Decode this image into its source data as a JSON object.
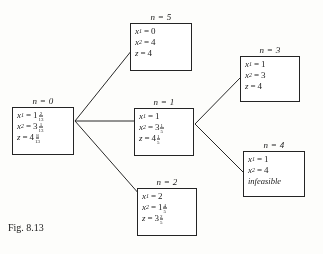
{
  "figure": {
    "caption": "Fig. 8.13",
    "type": "branch-and-bound-tree"
  },
  "nodes": [
    {
      "id": "0",
      "label": "n = 0",
      "rows": [
        {
          "var": "x",
          "sub": "1",
          "whole": "1",
          "num": "2",
          "den": "13"
        },
        {
          "var": "x",
          "sub": "2",
          "whole": "3",
          "num": "1",
          "den": "13"
        },
        {
          "var": "z",
          "sub": "",
          "whole": "4",
          "num": "8",
          "den": "13"
        }
      ]
    },
    {
      "id": "5",
      "label": "n = 5",
      "rows": [
        {
          "var": "x",
          "sub": "1",
          "whole": "0",
          "num": "",
          "den": ""
        },
        {
          "var": "x",
          "sub": "2",
          "whole": "4",
          "num": "",
          "den": ""
        },
        {
          "var": "z",
          "sub": "",
          "whole": "4",
          "num": "",
          "den": ""
        }
      ]
    },
    {
      "id": "1",
      "label": "n = 1",
      "rows": [
        {
          "var": "x",
          "sub": "1",
          "whole": "1",
          "num": "",
          "den": ""
        },
        {
          "var": "x",
          "sub": "2",
          "whole": "3",
          "num": "1",
          "den": "5"
        },
        {
          "var": "z",
          "sub": "",
          "whole": "4",
          "num": "1",
          "den": "5"
        }
      ]
    },
    {
      "id": "2",
      "label": "n = 2",
      "rows": [
        {
          "var": "x",
          "sub": "1",
          "whole": "2",
          "num": "",
          "den": ""
        },
        {
          "var": "x",
          "sub": "2",
          "whole": "1",
          "num": "4",
          "den": "5"
        },
        {
          "var": "z",
          "sub": "",
          "whole": "3",
          "num": "2",
          "den": "5"
        }
      ]
    },
    {
      "id": "3",
      "label": "n = 3",
      "rows": [
        {
          "var": "x",
          "sub": "1",
          "whole": "1",
          "num": "",
          "den": ""
        },
        {
          "var": "x",
          "sub": "2",
          "whole": "3",
          "num": "",
          "den": ""
        },
        {
          "var": "z",
          "sub": "",
          "whole": "4",
          "num": "",
          "den": ""
        }
      ]
    },
    {
      "id": "4",
      "label": "n = 4",
      "rows": [
        {
          "var": "x",
          "sub": "1",
          "whole": "1",
          "num": "",
          "den": ""
        },
        {
          "var": "x",
          "sub": "2",
          "whole": "4",
          "num": "",
          "den": ""
        }
      ],
      "status": "infeasible"
    }
  ],
  "edges": [
    {
      "from": "0",
      "to": "5"
    },
    {
      "from": "0",
      "to": "1"
    },
    {
      "from": "0",
      "to": "2"
    },
    {
      "from": "1",
      "to": "3"
    },
    {
      "from": "1",
      "to": "4"
    }
  ]
}
